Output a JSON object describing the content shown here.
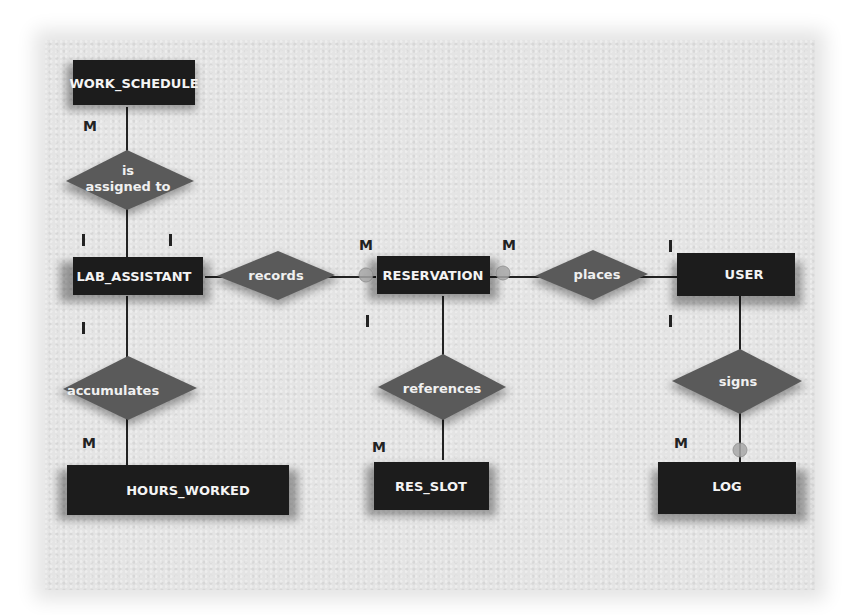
{
  "diagram": {
    "type": "entity-relationship",
    "entities": [
      {
        "id": "work_schedule",
        "label": "WORK_SCHEDULE"
      },
      {
        "id": "lab_assistant",
        "label": "LAB_ASSISTANT"
      },
      {
        "id": "reservation",
        "label": "RESERVATION"
      },
      {
        "id": "user",
        "label": "USER"
      },
      {
        "id": "hours_worked",
        "label": "HOURS_WORKED"
      },
      {
        "id": "res_slot",
        "label": "RES_SLOT"
      },
      {
        "id": "log",
        "label": "LOG"
      }
    ],
    "relationships": [
      {
        "id": "is_assigned_to",
        "label_line1": "is",
        "label_line2": "assigned to",
        "from": "lab_assistant",
        "to": "work_schedule",
        "from_card": "1",
        "to_card": "M"
      },
      {
        "id": "records",
        "label": "records",
        "from": "lab_assistant",
        "to": "reservation",
        "from_card": "1",
        "to_card": "M"
      },
      {
        "id": "places",
        "label": "places",
        "from": "user",
        "to": "reservation",
        "from_card": "1",
        "to_card": "M"
      },
      {
        "id": "accumulates",
        "label": "accumulates",
        "from": "lab_assistant",
        "to": "hours_worked",
        "from_card": "1",
        "to_card": "M"
      },
      {
        "id": "references",
        "label": "references",
        "from": "reservation",
        "to": "res_slot",
        "from_card": "1",
        "to_card": "M"
      },
      {
        "id": "signs",
        "label": "signs",
        "from": "user",
        "to": "log",
        "from_card": "1",
        "to_card": "M"
      }
    ],
    "cardinality": {
      "many": "M",
      "one": "I"
    }
  }
}
